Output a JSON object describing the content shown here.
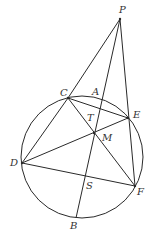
{
  "figure": {
    "type": "geometry-diagram",
    "circle": {
      "cx": 82,
      "cy": 157,
      "r": 61
    },
    "points": {
      "P": {
        "label": "P",
        "x": 120,
        "y": 19
      },
      "C": {
        "label": "C",
        "x": 68,
        "y": 98
      },
      "A": {
        "label": "A",
        "x": 99,
        "y": 96
      },
      "E": {
        "label": "E",
        "x": 128,
        "y": 118
      },
      "T": {
        "label": "T",
        "x": 96,
        "y": 115
      },
      "M": {
        "label": "M",
        "x": 94,
        "y": 133
      },
      "D": {
        "label": "D",
        "x": 22,
        "y": 163
      },
      "S": {
        "label": "S",
        "x": 84,
        "y": 177
      },
      "F": {
        "label": "F",
        "x": 135,
        "y": 186
      },
      "B": {
        "label": "B",
        "x": 76,
        "y": 218
      }
    },
    "segments": [
      "PC",
      "PB",
      "PF",
      "CE",
      "CD",
      "CF",
      "DE",
      "DF"
    ],
    "labels": [
      "P",
      "C",
      "A",
      "E",
      "T",
      "M",
      "D",
      "S",
      "F",
      "B"
    ]
  }
}
